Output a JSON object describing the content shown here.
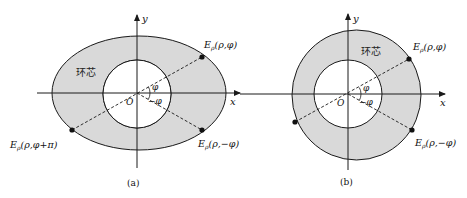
{
  "colors": {
    "annulus_fill": "#d9d9d9",
    "stroke": "#1a1a1a",
    "background": "#ffffff"
  },
  "panel_a": {
    "caption": "(a)",
    "region_label": "环芯",
    "axis_x": "x",
    "axis_y": "y",
    "origin": "O",
    "angle_pos": "φ",
    "angle_neg": "−φ",
    "point_1": "E",
    "point_1_sub": "ρ",
    "point_1_args": "(ρ,φ)",
    "point_2": "E",
    "point_2_sub": "ρ",
    "point_2_args": "(ρ,−φ)",
    "point_3": "E",
    "point_3_sub": "ρ",
    "point_3_args": "(ρ,φ+π)"
  },
  "panel_b": {
    "caption": "(b)",
    "region_label": "环芯",
    "axis_x": "x",
    "axis_y": "y",
    "origin": "O",
    "angle_pos": "φ",
    "angle_neg": "−φ",
    "point_1": "E",
    "point_1_sub": "ρ",
    "point_1_args": "(ρ,φ)",
    "point_2": "E",
    "point_2_sub": "ρ",
    "point_2_args": "(ρ,−φ)"
  }
}
